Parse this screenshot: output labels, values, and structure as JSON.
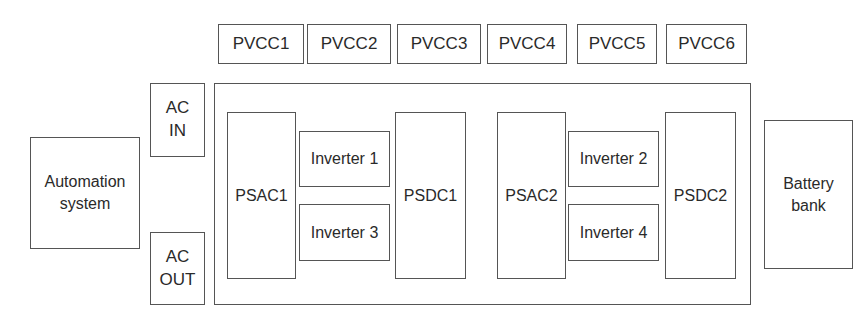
{
  "diagram": {
    "pvcc_row": [
      {
        "id": "pvcc1",
        "label": "PVCC1"
      },
      {
        "id": "pvcc2",
        "label": "PVCC2"
      },
      {
        "id": "pvcc3",
        "label": "PVCC3"
      },
      {
        "id": "pvcc4",
        "label": "PVCC4"
      },
      {
        "id": "pvcc5",
        "label": "PVCC5"
      },
      {
        "id": "pvcc6",
        "label": "PVCC6"
      }
    ],
    "automation_system": {
      "label": "Automation\nsystem"
    },
    "ac_in": {
      "label": "AC\nIN"
    },
    "ac_out": {
      "label": "AC\nOUT"
    },
    "battery_bank": {
      "label": "Battery\nbank"
    },
    "main_enclosure": {
      "group1": {
        "psac": {
          "label": "PSAC1"
        },
        "inverter_top": {
          "label": "Inverter 1"
        },
        "inverter_bottom": {
          "label": "Inverter 3"
        },
        "psdc": {
          "label": "PSDC1"
        }
      },
      "group2": {
        "psac": {
          "label": "PSAC2"
        },
        "inverter_top": {
          "label": "Inverter 2"
        },
        "inverter_bottom": {
          "label": "Inverter 4"
        },
        "psdc": {
          "label": "PSDC2"
        }
      }
    }
  }
}
